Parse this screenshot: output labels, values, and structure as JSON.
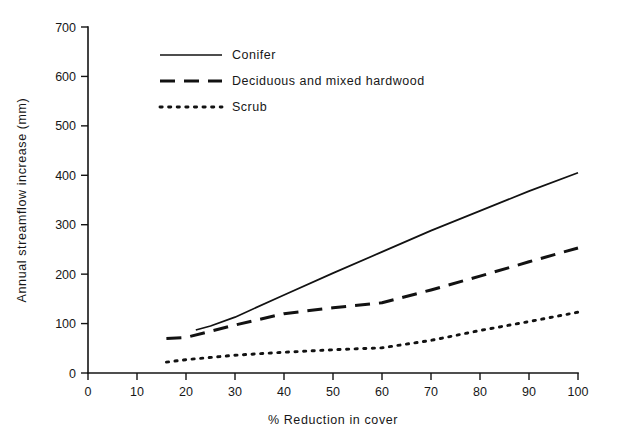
{
  "chart_data": {
    "type": "line",
    "title": "",
    "xlabel": "% Reduction in cover",
    "ylabel": "Annual streamflow increase (mm)",
    "xlim": [
      0,
      100
    ],
    "ylim": [
      0,
      700
    ],
    "xticks": [
      0,
      10,
      20,
      30,
      40,
      50,
      60,
      70,
      80,
      90,
      100
    ],
    "yticks": [
      0,
      100,
      200,
      300,
      400,
      500,
      600,
      700
    ],
    "grid": false,
    "legend_position": "upper-left-inside",
    "series": [
      {
        "name": "Conifer",
        "style": "solid",
        "x": [
          22,
          25,
          30,
          40,
          50,
          60,
          70,
          80,
          90,
          100
        ],
        "y": [
          87,
          95,
          113,
          158,
          202,
          245,
          288,
          328,
          368,
          405
        ]
      },
      {
        "name": "Deciduous and mixed hardwood",
        "style": "dashed",
        "x": [
          16,
          20,
          30,
          40,
          50,
          60,
          70,
          80,
          90,
          100
        ],
        "y": [
          70,
          72,
          97,
          120,
          132,
          142,
          168,
          196,
          225,
          253
        ]
      },
      {
        "name": "Scrub",
        "style": "dotted",
        "x": [
          16,
          20,
          30,
          40,
          50,
          60,
          70,
          80,
          90,
          100
        ],
        "y": [
          22,
          27,
          36,
          42,
          47,
          51,
          66,
          86,
          104,
          123
        ]
      }
    ]
  },
  "axes": {
    "x_label": "% Reduction in cover",
    "y_label": "Annual streamflow increase (mm)",
    "x_tick_labels": [
      "0",
      "10",
      "20",
      "30",
      "40",
      "50",
      "60",
      "70",
      "80",
      "90",
      "100"
    ],
    "y_tick_labels": [
      "0",
      "100",
      "200",
      "300",
      "400",
      "500",
      "600",
      "700"
    ]
  },
  "legend": {
    "entries": [
      {
        "label": "Conifer",
        "style": "solid"
      },
      {
        "label": "Deciduous and mixed hardwood",
        "style": "dashed"
      },
      {
        "label": "Scrub",
        "style": "dotted"
      }
    ]
  },
  "colors": {
    "ink": "#121212",
    "background": "#ffffff"
  }
}
